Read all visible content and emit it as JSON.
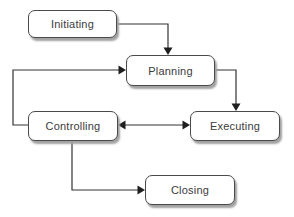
{
  "diagram": {
    "type": "flowchart",
    "nodes": [
      {
        "id": "initiating",
        "label": "Initiating"
      },
      {
        "id": "planning",
        "label": "Planning"
      },
      {
        "id": "controlling",
        "label": "Controlling"
      },
      {
        "id": "executing",
        "label": "Executing"
      },
      {
        "id": "closing",
        "label": "Closing"
      }
    ],
    "edges": [
      {
        "from": "initiating",
        "to": "planning",
        "style": "single-arrow"
      },
      {
        "from": "controlling",
        "to": "planning",
        "style": "single-arrow"
      },
      {
        "from": "planning",
        "to": "executing",
        "style": "single-arrow"
      },
      {
        "from": "controlling",
        "to": "executing",
        "style": "double-arrow"
      },
      {
        "from": "controlling",
        "to": "closing",
        "style": "single-arrow"
      }
    ],
    "colors": {
      "background": "#ffffff",
      "box_fill": "#ffffff",
      "box_border": "#4a4a4a",
      "box_shadow": "#a2a2a2",
      "line": "#333333",
      "arrowhead": "#1f1f1f",
      "text": "#3b3b3b"
    }
  }
}
